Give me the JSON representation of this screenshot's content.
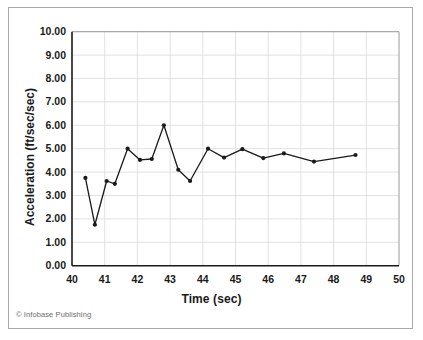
{
  "figure": {
    "copyright": "© Infobase Publishing"
  },
  "chart_data": {
    "type": "line",
    "title": "",
    "xlabel": "Time (sec)",
    "ylabel": "Acceleration (ft/sec/sec)",
    "xlim": [
      40,
      50
    ],
    "ylim": [
      0,
      10
    ],
    "xticks": [
      "40",
      "41",
      "42",
      "43",
      "44",
      "45",
      "46",
      "47",
      "48",
      "49",
      "50"
    ],
    "xtick_values": [
      40,
      41,
      42,
      43,
      44,
      45,
      46,
      47,
      48,
      49,
      50
    ],
    "yticks": [
      "0.00",
      "1.00",
      "2.00",
      "3.00",
      "4.00",
      "5.00",
      "6.00",
      "7.00",
      "8.00",
      "9.00",
      "10.00"
    ],
    "ytick_values": [
      0,
      1,
      2,
      3,
      4,
      5,
      6,
      7,
      8,
      9,
      10
    ],
    "grid": true,
    "legend": null,
    "marker": "circle",
    "line_color": "#1a1a1a",
    "marker_color": "#1a1a1a",
    "grid_color": "#d9d9d9",
    "axis_color": "#1a1a1a",
    "x": [
      40.41,
      40.7,
      41.06,
      41.31,
      41.7,
      42.08,
      42.44,
      42.81,
      43.25,
      43.61,
      44.16,
      44.65,
      45.21,
      45.85,
      46.48,
      47.4,
      48.67
    ],
    "y": [
      3.75,
      1.75,
      3.62,
      3.5,
      5.0,
      4.52,
      4.56,
      6.0,
      4.1,
      3.62,
      5.0,
      4.62,
      4.98,
      4.6,
      4.8,
      4.45,
      4.73
    ]
  }
}
